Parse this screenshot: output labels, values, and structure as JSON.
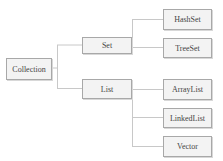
{
  "diagram": {
    "type": "tree",
    "root": {
      "label": "Collection"
    },
    "level1": [
      {
        "label": "Set",
        "children": [
          "HashSet",
          "TreeSet"
        ]
      },
      {
        "label": "List",
        "children": [
          "ArrayList",
          "LinkedList",
          "Vector"
        ]
      }
    ],
    "nodes": {
      "collection": "Collection",
      "set": "Set",
      "list": "List",
      "hashset": "HashSet",
      "treeset": "TreeSet",
      "arraylist": "ArrayList",
      "linkedlist": "LinkedList",
      "vector": "Vector"
    },
    "colors": {
      "line": "#c8c8c8",
      "border": "#a8a8a8",
      "fill": "#f3f3f3",
      "text": "#444444"
    }
  }
}
